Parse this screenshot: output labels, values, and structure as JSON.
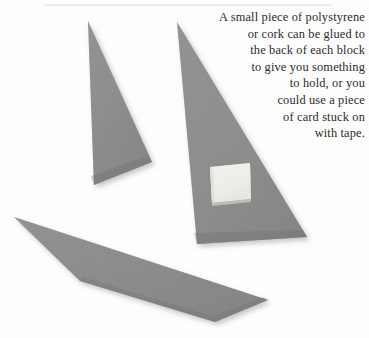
{
  "page": {
    "width": 369,
    "height": 338,
    "background_color": "#fdfdfd",
    "kind": "instructional-photograph"
  },
  "caption": {
    "alignment": "right",
    "text_color": "#2c2a29",
    "full_text": "A small piece of polystyrene or cork can be glued to the back of each block to give you something to hold, or you could use a piece of card stuck on with tape.",
    "lines": [
      "A small piece of polystyrene",
      "or cork can be glued to",
      "the back of each block",
      "to give you something",
      "to hold, or you",
      "could use a piece",
      "of card stuck on",
      "with tape."
    ]
  },
  "photo": {
    "rule_line": {
      "name": "top-rule",
      "color": "#d8d6d4",
      "x1": 45,
      "y1": 5,
      "x2": 331,
      "y2": 5
    },
    "shapes": [
      {
        "name": "small-grey-triangle-left",
        "label": "Small grey printing block (triangle)",
        "fill": "#8d8d8b",
        "points": "88,21 94,185 152,162"
      },
      {
        "name": "large-grey-triangle-center",
        "label": "Large grey printing block (triangle) with polystyrene handle",
        "fill": "#8b8b89",
        "points": "177,22 197,244 307,237"
      },
      {
        "name": "elongated-grey-quadrilateral-bottom",
        "label": "Long thin grey printing block (sliver)",
        "fill": "#8b8b89",
        "points": "14,217 268,300 215,322 80,281"
      }
    ],
    "polystyrene_block": {
      "name": "polystyrene-block",
      "label": "Small white polystyrene piece glued to block",
      "fill": "#f2f1ee",
      "edge_fill": "#c9c7c2",
      "points": "210,167 250,163 251,199 212,203"
    },
    "colors": {
      "grey_block": "#8b8b89",
      "polystyrene_white": "#f2f1ee",
      "shadow": "#cfcdca",
      "background": "#fdfdfd"
    }
  }
}
